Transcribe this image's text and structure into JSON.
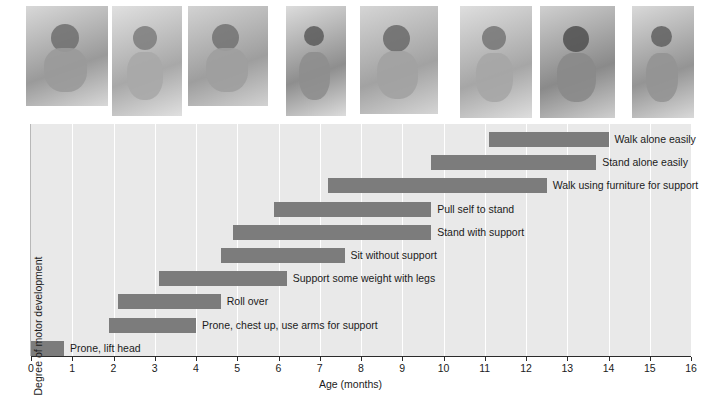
{
  "chart_data": {
    "type": "bar",
    "orientation": "horizontal",
    "subtype": "range-bar",
    "title": "",
    "xlabel": "Age (months)",
    "ylabel": "Degree of motor development",
    "xlim": [
      0,
      16
    ],
    "xticks": [
      "0",
      "1",
      "2",
      "3",
      "4",
      "5",
      "6",
      "7",
      "8",
      "9",
      "10",
      "11",
      "12",
      "13",
      "14",
      "15",
      "16"
    ],
    "grid": "vertical-white-gridlines",
    "legend": "none",
    "bar_color": "#7c7c7c",
    "plot_background": "#e9e9e9",
    "categories": [
      "Walk alone easily",
      "Stand alone easily",
      "Walk using furniture for support",
      "Pull self to stand",
      "Stand with support",
      "Sit without support",
      "Support some weight with legs",
      "Roll over",
      "Prone, chest up, use arms for support",
      "Prone, lift head"
    ],
    "ranges": [
      {
        "label": "Walk alone easily",
        "start": 11.1,
        "end": 14.0
      },
      {
        "label": "Stand alone easily",
        "start": 9.7,
        "end": 13.7
      },
      {
        "label": "Walk using furniture for support",
        "start": 7.2,
        "end": 12.5
      },
      {
        "label": "Pull self to stand",
        "start": 5.9,
        "end": 9.7
      },
      {
        "label": "Stand with support",
        "start": 4.9,
        "end": 9.7
      },
      {
        "label": "Sit without support",
        "start": 4.6,
        "end": 7.6
      },
      {
        "label": "Support some weight with legs",
        "start": 3.1,
        "end": 6.2
      },
      {
        "label": "Roll over",
        "start": 2.1,
        "end": 4.6
      },
      {
        "label": "Prone, chest up, use arms for support",
        "start": 1.9,
        "end": 4.0
      },
      {
        "label": "Prone, lift head",
        "start": 0.0,
        "end": 0.8
      }
    ]
  },
  "photos": {
    "count": 8,
    "description": "grayscale infant motor-milestone photographs",
    "items": [
      {
        "name": "infant-prone-lift-head-photo"
      },
      {
        "name": "infant-rolling-over-photo"
      },
      {
        "name": "infant-crawling-photo"
      },
      {
        "name": "infant-sitting-photo"
      },
      {
        "name": "infant-pull-to-stand-photo"
      },
      {
        "name": "infant-cruising-furniture-photo"
      },
      {
        "name": "infant-standing-assisted-photo"
      },
      {
        "name": "infant-walking-alone-photo"
      }
    ]
  }
}
